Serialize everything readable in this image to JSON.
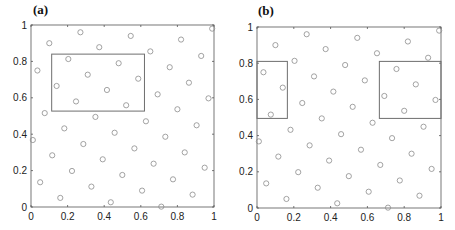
{
  "chart_data": [
    {
      "type": "scatter",
      "title": "(a)",
      "xlabel": "",
      "ylabel": "",
      "xlim": [
        0,
        1
      ],
      "ylim": [
        0,
        1
      ],
      "grid": false,
      "xticks": [
        "0",
        "0.2",
        "0.4",
        "0.6",
        "0.8",
        "1"
      ],
      "yticks": [
        "0",
        "0.2",
        "0.4",
        "0.6",
        "0.8",
        "1"
      ],
      "marker": "open-circle",
      "marker_color": "#8c8c8c",
      "rectangles": [
        {
          "x0": 0.113,
          "y0": 0.527,
          "x1": 0.62,
          "y1": 0.84
        }
      ],
      "points": [
        [
          0.99,
          0.98
        ],
        [
          0.27,
          0.96
        ],
        [
          0.545,
          0.94
        ],
        [
          0.82,
          0.92
        ],
        [
          0.1,
          0.9
        ],
        [
          0.373,
          0.878
        ],
        [
          0.652,
          0.855
        ],
        [
          0.93,
          0.83
        ],
        [
          0.204,
          0.813
        ],
        [
          0.479,
          0.79
        ],
        [
          0.758,
          0.768
        ],
        [
          0.035,
          0.75
        ],
        [
          0.31,
          0.727
        ],
        [
          0.586,
          0.705
        ],
        [
          0.863,
          0.683
        ],
        [
          0.14,
          0.665
        ],
        [
          0.415,
          0.643
        ],
        [
          0.692,
          0.619
        ],
        [
          0.97,
          0.597
        ],
        [
          0.246,
          0.58
        ],
        [
          0.52,
          0.559
        ],
        [
          0.8,
          0.537
        ],
        [
          0.075,
          0.516
        ],
        [
          0.352,
          0.495
        ],
        [
          0.628,
          0.471
        ],
        [
          0.905,
          0.449
        ],
        [
          0.182,
          0.432
        ],
        [
          0.457,
          0.408
        ],
        [
          0.734,
          0.386
        ],
        [
          0.01,
          0.368
        ],
        [
          0.286,
          0.346
        ],
        [
          0.565,
          0.322
        ],
        [
          0.84,
          0.3
        ],
        [
          0.116,
          0.284
        ],
        [
          0.392,
          0.262
        ],
        [
          0.67,
          0.238
        ],
        [
          0.949,
          0.216
        ],
        [
          0.224,
          0.198
        ],
        [
          0.499,
          0.176
        ],
        [
          0.776,
          0.152
        ],
        [
          0.05,
          0.136
        ],
        [
          0.33,
          0.112
        ],
        [
          0.607,
          0.09
        ],
        [
          0.883,
          0.068
        ],
        [
          0.16,
          0.05
        ],
        [
          0.436,
          0.026
        ],
        [
          0.712,
          0.002
        ]
      ]
    },
    {
      "type": "scatter",
      "title": "(b)",
      "xlabel": "",
      "ylabel": "",
      "xlim": [
        0,
        1
      ],
      "ylim": [
        0,
        1
      ],
      "grid": false,
      "xticks": [
        "0",
        "0.2",
        "0.4",
        "0.6",
        "0.8",
        "1"
      ],
      "yticks": [
        "0",
        "0.2",
        "0.4",
        "0.6",
        "0.8",
        "1"
      ],
      "marker": "open-circle",
      "marker_color": "#8c8c8c",
      "rectangles": [
        {
          "x0": 0.0,
          "y0": 0.495,
          "x1": 0.165,
          "y1": 0.81
        },
        {
          "x0": 0.665,
          "y0": 0.495,
          "x1": 1.0,
          "y1": 0.81
        }
      ],
      "points": [
        [
          0.99,
          0.98
        ],
        [
          0.27,
          0.96
        ],
        [
          0.545,
          0.94
        ],
        [
          0.82,
          0.92
        ],
        [
          0.1,
          0.9
        ],
        [
          0.373,
          0.878
        ],
        [
          0.652,
          0.855
        ],
        [
          0.93,
          0.83
        ],
        [
          0.204,
          0.813
        ],
        [
          0.479,
          0.79
        ],
        [
          0.758,
          0.768
        ],
        [
          0.035,
          0.75
        ],
        [
          0.31,
          0.727
        ],
        [
          0.586,
          0.705
        ],
        [
          0.863,
          0.683
        ],
        [
          0.14,
          0.665
        ],
        [
          0.415,
          0.643
        ],
        [
          0.692,
          0.619
        ],
        [
          0.97,
          0.597
        ],
        [
          0.246,
          0.58
        ],
        [
          0.52,
          0.559
        ],
        [
          0.8,
          0.537
        ],
        [
          0.075,
          0.516
        ],
        [
          0.352,
          0.495
        ],
        [
          0.628,
          0.471
        ],
        [
          0.905,
          0.449
        ],
        [
          0.182,
          0.432
        ],
        [
          0.457,
          0.408
        ],
        [
          0.734,
          0.386
        ],
        [
          0.01,
          0.368
        ],
        [
          0.286,
          0.346
        ],
        [
          0.565,
          0.322
        ],
        [
          0.84,
          0.3
        ],
        [
          0.116,
          0.284
        ],
        [
          0.392,
          0.262
        ],
        [
          0.67,
          0.238
        ],
        [
          0.949,
          0.216
        ],
        [
          0.224,
          0.198
        ],
        [
          0.499,
          0.176
        ],
        [
          0.776,
          0.152
        ],
        [
          0.05,
          0.136
        ],
        [
          0.33,
          0.112
        ],
        [
          0.607,
          0.09
        ],
        [
          0.883,
          0.068
        ],
        [
          0.16,
          0.05
        ],
        [
          0.436,
          0.026
        ],
        [
          0.712,
          0.002
        ]
      ]
    }
  ],
  "panels": [
    {
      "label": "(a)"
    },
    {
      "label": "(b)"
    }
  ],
  "style": {
    "axis_color": "#555555",
    "rect_color": "#6e6e6e",
    "marker_color": "#8c8c8c",
    "tick_label_color": "#222222"
  }
}
